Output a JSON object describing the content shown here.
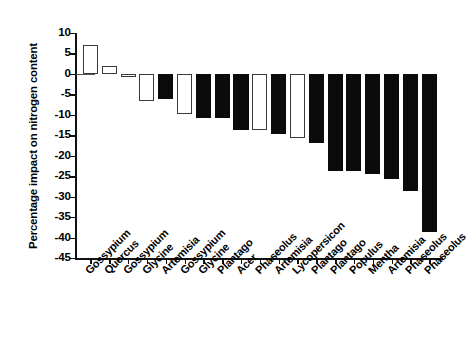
{
  "chart_data": {
    "type": "bar",
    "title": "",
    "subtitle": "",
    "xlabel": "",
    "ylabel": "Percentage impact on nitrogen content",
    "ylim": [
      -45,
      10
    ],
    "yticks": [
      10,
      5,
      0,
      -5,
      -10,
      -15,
      -20,
      -25,
      -30,
      -35,
      -40,
      -45
    ],
    "ytick_labels": [
      "10",
      "5",
      "0",
      "-5",
      "-10",
      "-15",
      "-20",
      "-25",
      "-30",
      "-35",
      "-40",
      "-45"
    ],
    "grid": false,
    "legend": "none",
    "categories": [
      "Gossypium",
      "Quercus",
      "Gossypium",
      "Glycine",
      "Artemisia",
      "Gossypium",
      "Glycine",
      "Plantago",
      "Acer",
      "Phaseolus",
      "Artemisia",
      "Lycopersicon",
      "Plantago",
      "Plantago",
      "Populus",
      "Mentha",
      "Artemisia",
      "Phaseolus",
      "Phaseolus"
    ],
    "values": [
      7,
      2,
      -0.8,
      -6.7,
      -6.2,
      -9.7,
      -10.8,
      -10.7,
      -13.6,
      -13.6,
      -14.8,
      -15.6,
      -16.8,
      -23.7,
      -23.7,
      -24.4,
      -25.7,
      -28.6,
      -38.6
    ],
    "fills": [
      "open",
      "open",
      "open",
      "open",
      "solid",
      "open",
      "solid",
      "solid",
      "solid",
      "open",
      "solid",
      "open",
      "solid",
      "solid",
      "solid",
      "solid",
      "solid",
      "solid",
      "solid"
    ],
    "colors": {
      "open_fill": "#ffffff",
      "solid_fill": "#0b0b0b",
      "edge": "#3a3a3a",
      "axis": "#111111"
    }
  }
}
